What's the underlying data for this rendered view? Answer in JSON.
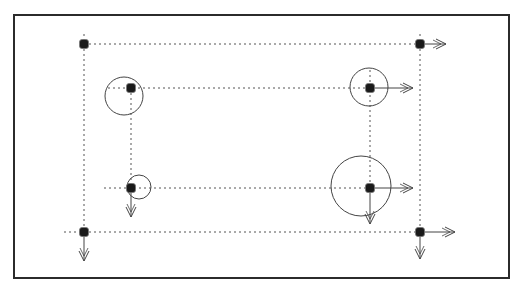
{
  "diagram": {
    "type": "node-grid-with-force-arrows",
    "colors": {
      "background": "#ffffff",
      "frame": "#2b2b2b",
      "node": "#1a1a1a",
      "dotted_line": "#555555",
      "circle": "#444444",
      "arrow": "#444444"
    },
    "frame": {
      "x1": 14,
      "y1": 15,
      "x2": 509,
      "y2": 278
    },
    "nodes": [
      {
        "id": "n1",
        "x": 84,
        "y": 44
      },
      {
        "id": "n2",
        "x": 420,
        "y": 44
      },
      {
        "id": "n3",
        "x": 131,
        "y": 88
      },
      {
        "id": "n4",
        "x": 370,
        "y": 88
      },
      {
        "id": "n5",
        "x": 131,
        "y": 188
      },
      {
        "id": "n6",
        "x": 370,
        "y": 188
      },
      {
        "id": "n7",
        "x": 84,
        "y": 232
      },
      {
        "id": "n8",
        "x": 420,
        "y": 232
      }
    ],
    "dotted_lines": [
      {
        "x1": 84,
        "y1": 44,
        "x2": 420,
        "y2": 44
      },
      {
        "x1": 108,
        "y1": 88,
        "x2": 370,
        "y2": 88
      },
      {
        "x1": 104,
        "y1": 188,
        "x2": 370,
        "y2": 188
      },
      {
        "x1": 64,
        "y1": 232,
        "x2": 420,
        "y2": 232
      },
      {
        "x1": 84,
        "y1": 34,
        "x2": 84,
        "y2": 232
      },
      {
        "x1": 420,
        "y1": 34,
        "x2": 420,
        "y2": 232
      },
      {
        "x1": 131,
        "y1": 88,
        "x2": 131,
        "y2": 188
      },
      {
        "x1": 370,
        "y1": 70,
        "x2": 370,
        "y2": 188
      }
    ],
    "circles": [
      {
        "cx": 124,
        "cy": 96,
        "r": 19
      },
      {
        "cx": 369,
        "cy": 87,
        "r": 19
      },
      {
        "cx": 139,
        "cy": 187,
        "r": 12
      },
      {
        "cx": 361,
        "cy": 186,
        "r": 30
      }
    ],
    "arrows": [
      {
        "from": "n2",
        "x1": 420,
        "y1": 44,
        "x2": 446,
        "y2": 44,
        "direction": "right"
      },
      {
        "from": "n4",
        "x1": 370,
        "y1": 88,
        "x2": 413,
        "y2": 88,
        "direction": "right"
      },
      {
        "from": "n6",
        "x1": 370,
        "y1": 188,
        "x2": 413,
        "y2": 188,
        "direction": "right"
      },
      {
        "from": "n8",
        "x1": 420,
        "y1": 232,
        "x2": 455,
        "y2": 232,
        "direction": "right"
      },
      {
        "from": "n5",
        "x1": 131,
        "y1": 188,
        "x2": 131,
        "y2": 217,
        "direction": "down"
      },
      {
        "from": "n7",
        "x1": 84,
        "y1": 232,
        "x2": 84,
        "y2": 261,
        "direction": "down"
      },
      {
        "from": "n6",
        "x1": 370,
        "y1": 188,
        "x2": 370,
        "y2": 224,
        "direction": "down"
      },
      {
        "from": "n8",
        "x1": 420,
        "y1": 232,
        "x2": 420,
        "y2": 259,
        "direction": "down"
      }
    ]
  }
}
